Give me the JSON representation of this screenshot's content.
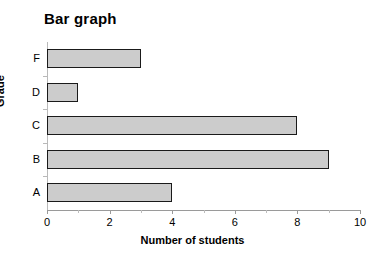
{
  "chart_data": {
    "type": "bar",
    "orientation": "horizontal",
    "title": "Bar graph",
    "xlabel": "Number of students",
    "ylabel": "Grade",
    "categories": [
      "A",
      "B",
      "C",
      "D",
      "F"
    ],
    "values": [
      4,
      9,
      8,
      1,
      3
    ],
    "display_order_top_to_bottom": [
      "F",
      "D",
      "C",
      "B",
      "A"
    ],
    "xlim": [
      0,
      10
    ],
    "xticks": [
      0,
      2,
      4,
      6,
      8,
      10
    ],
    "xticklabels": [
      "0",
      "2",
      "4",
      "6",
      "8",
      "10"
    ],
    "x_minor_ticks": [
      1,
      3,
      5,
      7,
      9
    ],
    "grid": false,
    "legend": false,
    "bar_fill_color": "#cccccc",
    "bar_border_color": "#1a1a1a",
    "background_color": "#ffffff",
    "axis_color": "#9a9a9a"
  }
}
